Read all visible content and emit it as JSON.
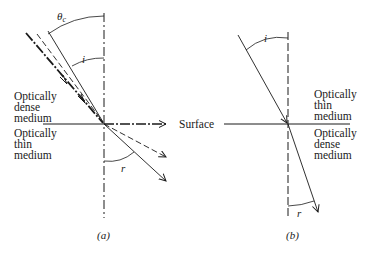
{
  "figure": {
    "panel_a": {
      "caption": "(a)",
      "upper_medium": [
        "Optically",
        "dense",
        "medium"
      ],
      "lower_medium": [
        "Optically",
        "thin",
        "medium"
      ],
      "surface_label": "Surface",
      "angle_labels": {
        "critical": "θc",
        "critical_main": "θ",
        "critical_sub": "c",
        "incidence": "i",
        "refraction": "r"
      }
    },
    "panel_b": {
      "caption": "(b)",
      "upper_medium": [
        "Optically",
        "thin",
        "medium"
      ],
      "lower_medium": [
        "Optically",
        "dense",
        "medium"
      ],
      "angle_labels": {
        "incidence": "i",
        "refraction": "r"
      }
    },
    "colors": {
      "ink": "#1a1a1a",
      "background": "#ffffff"
    }
  }
}
